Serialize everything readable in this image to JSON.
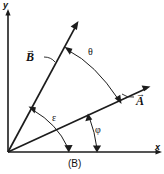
{
  "figure": {
    "caption": "(B)",
    "background_color": "#ffffff",
    "ink_color": "#1c1c1c",
    "width": 164,
    "height": 174
  },
  "axes": {
    "y_label": "y",
    "x_label": "x",
    "origin": {
      "x": 8,
      "y": 152
    },
    "y_axis": {
      "x": 8,
      "y_top": 12,
      "y_bottom": 152
    },
    "x_axis": {
      "y": 152,
      "x_left": 8,
      "x_right": 161
    }
  },
  "vectors": [
    {
      "name": "B",
      "label": "B",
      "overbar": "→",
      "tail": {
        "x": 8,
        "y": 152
      },
      "tip": {
        "x": 78,
        "y": 22
      },
      "label_position": {
        "x": 26,
        "y": 48
      }
    },
    {
      "name": "A",
      "label": "A",
      "overbar": "→",
      "tail": {
        "x": 8,
        "y": 152
      },
      "tip": {
        "x": 149,
        "y": 86
      },
      "label_position": {
        "x": 136,
        "y": 92
      }
    }
  ],
  "angles": [
    {
      "name": "theta",
      "symbol": "θ",
      "between": [
        "B",
        "A"
      ],
      "arrowheads": "both",
      "label_position": {
        "x": 88,
        "y": 47
      }
    },
    {
      "name": "epsilon",
      "symbol": "ε",
      "between": [
        "B",
        "x-axis"
      ],
      "arrowheads": "both",
      "label_position": {
        "x": 52,
        "y": 113
      }
    },
    {
      "name": "phi",
      "symbol": "φ",
      "between": [
        "A",
        "x-axis"
      ],
      "arrowheads": "both",
      "label_position": {
        "x": 95,
        "y": 125
      }
    }
  ]
}
